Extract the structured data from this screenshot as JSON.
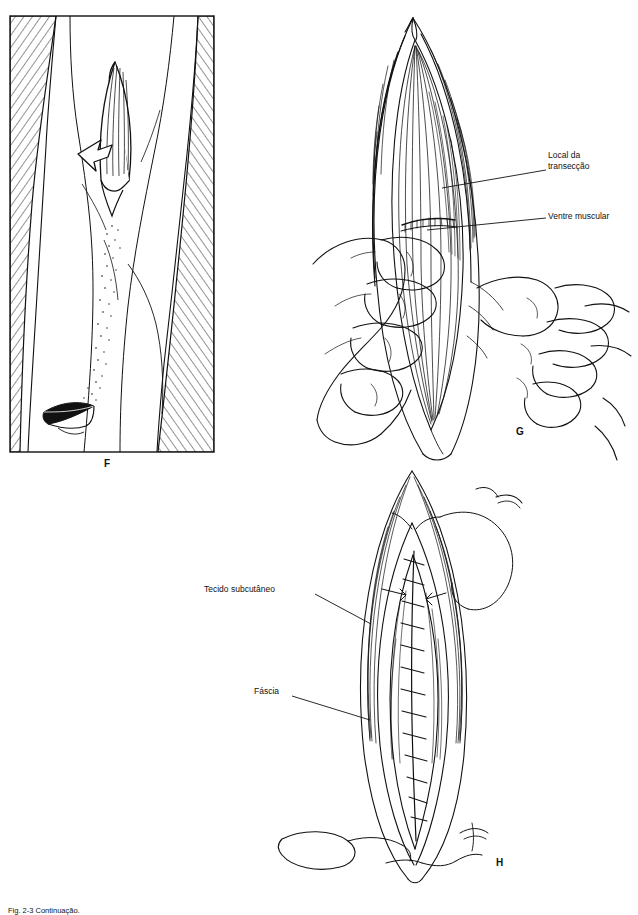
{
  "page": {
    "width": 638,
    "height": 915,
    "background": "#ffffff",
    "ink": "#111111"
  },
  "figure": {
    "caption_partial": "Fig. 2-3  Continuação.",
    "panels": [
      {
        "id": "F",
        "label": "F",
        "name": "panel-f-skin-incision",
        "description": "Vista da coxa com incisão na pele e hachuras laterais, seta indicando a direção"
      },
      {
        "id": "G",
        "label": "G",
        "name": "panel-g-muscle-transection",
        "description": "Mãos segurando o ventre muscular exposto com local da transecção indicado"
      },
      {
        "id": "H",
        "label": "H",
        "name": "panel-h-suture-closure",
        "description": "Ferida fechada com sutura contínua, agulha e fio visíveis"
      }
    ],
    "callouts": [
      {
        "id": "local-da-transeccao",
        "text": "Local da\ntransecção",
        "panel": "G"
      },
      {
        "id": "ventre-muscular",
        "text": "Ventre muscular",
        "panel": "G"
      },
      {
        "id": "tecido-subcutaneo",
        "text": "Tecido subcutâneo",
        "panel": "H"
      },
      {
        "id": "fascia",
        "text": "Fáscia",
        "panel": "H"
      }
    ]
  }
}
